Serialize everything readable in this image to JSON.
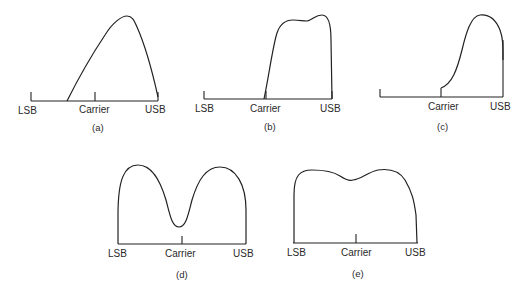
{
  "figure": {
    "panels": [
      {
        "id": "a",
        "caption": "(a)",
        "labels": {
          "lsb": "LSB",
          "carrier": "Carrier",
          "usb": "USB"
        },
        "description": "Asymmetric spectrum rising from between LSB and carrier, peaking near USB"
      },
      {
        "id": "b",
        "caption": "(b)",
        "labels": {
          "lsb": "LSB",
          "carrier": "Carrier",
          "usb": "USB"
        },
        "description": "Upper sideband only with two slight humps"
      },
      {
        "id": "c",
        "caption": "(c)",
        "labels": {
          "lsb": "",
          "carrier": "Carrier",
          "usb": "USB"
        },
        "description": "Upper sideband rising from carrier with peak near USB"
      },
      {
        "id": "d",
        "caption": "(d)",
        "labels": {
          "lsb": "LSB",
          "carrier": "Carrier",
          "usb": "USB"
        },
        "description": "Double sideband with deep dip at carrier"
      },
      {
        "id": "e",
        "caption": "(e)",
        "labels": {
          "lsb": "LSB",
          "carrier": "Carrier",
          "usb": "USB"
        },
        "description": "Double sideband with shallow dip at carrier"
      }
    ]
  }
}
